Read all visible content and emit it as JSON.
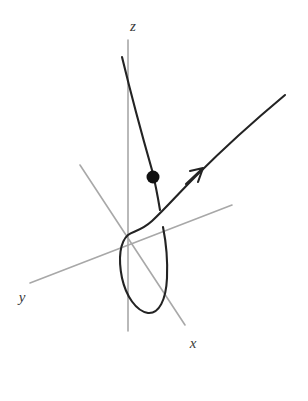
{
  "figure": {
    "background_color": "#ffffff",
    "width": 308,
    "height": 401
  },
  "axes": {
    "color": "#a8a8a8",
    "origin": {
      "x": 127,
      "y": 240
    },
    "items": [
      {
        "name": "z",
        "label": "z",
        "label_x": 133,
        "label_y": 28,
        "path": "M 128 40 L 128 331",
        "description": "vertical z-axis"
      },
      {
        "name": "y",
        "label": "y",
        "label_x": 22,
        "label_y": 299,
        "path": "M 30 283 L 232 205",
        "description": "y-axis toward lower-left"
      },
      {
        "name": "x",
        "label": "x",
        "label_x": 193,
        "label_y": 345,
        "path": "M 80 165 L 185 325",
        "description": "x-axis toward lower-right"
      }
    ]
  },
  "curve": {
    "name": "space-curve",
    "color": "#232323",
    "stroke_width": 2.1,
    "segments": [
      {
        "name": "upper-descending-branch",
        "path": "M 122 57 C 130 90, 142 135, 152 170 C 156 186, 158 198, 160 210"
      },
      {
        "name": "loop-and-outgoing-branch",
        "path": "M 285 95 C 255 120, 220 152, 196 176 C 178 194, 164 210, 152 221 C 141 231, 133 231, 128 235 C 120 242, 118 258, 122 278 C 126 296, 136 311, 148 313 C 159 314, 166 300, 167 278 C 168 255, 165 237, 163 227"
      }
    ]
  },
  "arrow": {
    "name": "direction-arrow",
    "tip_x": 203,
    "tip_y": 168,
    "path": "M 186 184 L 203 168 M 203 168 L 190 171 M 203 168 L 198 182",
    "color": "#232323"
  },
  "point": {
    "name": "marked-point",
    "x": 153,
    "y": 177,
    "radius": 6.5,
    "color": "#111111"
  },
  "chart_data": {
    "type": "line",
    "xlabel": "x",
    "ylabel": "y",
    "zlabel": "z",
    "grid": false,
    "legend": "none",
    "annotations": [
      {
        "label": "x",
        "kind": "axis-label"
      },
      {
        "label": "y",
        "kind": "axis-label"
      },
      {
        "label": "z",
        "kind": "axis-label"
      },
      {
        "label": "dot",
        "kind": "point-marker"
      },
      {
        "label": "arrow",
        "kind": "direction-marker"
      }
    ]
  }
}
